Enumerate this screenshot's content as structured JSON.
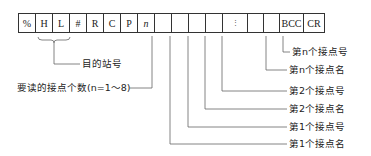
{
  "frame": {
    "cells": [
      {
        "text": "%",
        "width": 18
      },
      {
        "text": "H",
        "width": 18
      },
      {
        "text": "L",
        "width": 18
      },
      {
        "text": "#",
        "width": 18
      },
      {
        "text": "R",
        "width": 18
      },
      {
        "text": "C",
        "width": 18
      },
      {
        "text": "P",
        "width": 18
      },
      {
        "text": "n",
        "width": 18,
        "italic": true
      },
      {
        "text": "",
        "width": 18
      },
      {
        "text": "",
        "width": 18
      },
      {
        "text": "",
        "width": 18
      },
      {
        "text": "",
        "width": 18
      },
      {
        "text": "⋮",
        "width": 26,
        "dots": true
      },
      {
        "text": "",
        "width": 17
      },
      {
        "text": "",
        "width": 17
      },
      {
        "text": "BCC",
        "width": 25
      },
      {
        "text": "CR",
        "width": 22
      }
    ]
  },
  "labels": {
    "station": "目的站号",
    "count": "要读的接点个数(n=1～8)",
    "nth_number": "第n个接点号",
    "nth_name": "第n个接点名",
    "second_number": "第2个接点号",
    "second_name": "第2个接点名",
    "first_number": "第1个接点号",
    "first_name": "第1个接点名"
  }
}
